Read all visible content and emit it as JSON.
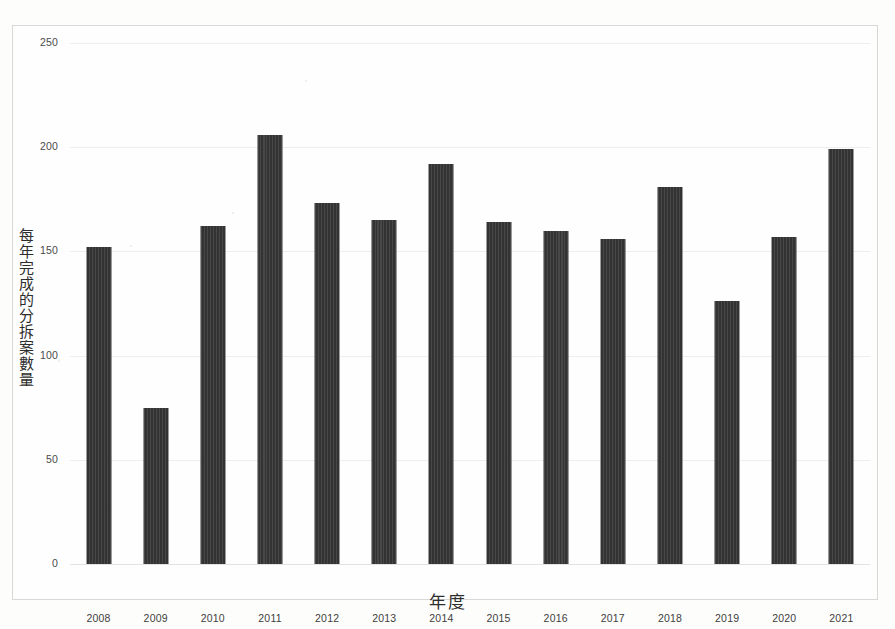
{
  "chart_data": {
    "type": "bar",
    "title": "",
    "subtitle": "",
    "xlabel": "年度",
    "ylabel": "每年完成的分拆案數量",
    "categories": [
      "2008",
      "2009",
      "2010",
      "2011",
      "2012",
      "2013",
      "2014",
      "2015",
      "2016",
      "2017",
      "2018",
      "2019",
      "2020",
      "2021"
    ],
    "values": [
      152,
      75,
      162,
      206,
      173,
      165,
      192,
      164,
      160,
      156,
      181,
      126,
      157,
      199
    ],
    "ylim": [
      0,
      250
    ],
    "ytick_labels": [
      "0",
      "50",
      "100",
      "150",
      "200",
      "250"
    ],
    "ytick_values": [
      0,
      50,
      100,
      150,
      200,
      250
    ],
    "grid": true,
    "legend": "none",
    "bar_color": "#333333",
    "gridline_color": "#eeeeec",
    "background_color": "#fefefe",
    "frame_color": "#d8d8d6"
  },
  "axis": {
    "y_title_chars": [
      "每",
      "年",
      "完",
      "成",
      "的",
      "分",
      "拆",
      "案",
      "數",
      "量"
    ],
    "x_title": "年度"
  }
}
